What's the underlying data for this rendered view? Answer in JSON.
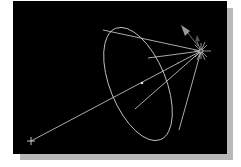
{
  "diagram": {
    "type": "spotlight-cone-viewport",
    "colors": {
      "background": "#000000",
      "shadow": "#b8b8b8",
      "lines": "#d8d8d8",
      "icon": "#a0a0a0"
    },
    "elements": {
      "light_source": "spotlight-star-icon",
      "target": "target-cross-icon",
      "cone_base": "ellipse",
      "direction_arrow": "arrow-icon"
    }
  }
}
